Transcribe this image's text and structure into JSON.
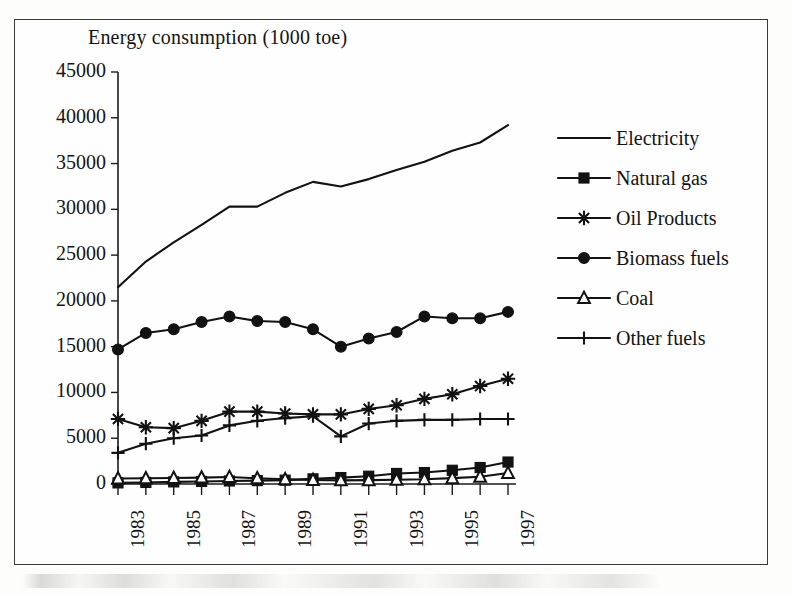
{
  "chart_data": {
    "type": "line",
    "title": "Energy consumption (1000 toe)",
    "xlabel": "",
    "ylabel": "",
    "xlim": [
      1983,
      1997
    ],
    "ylim": [
      0,
      45000
    ],
    "ytick_step": 5000,
    "grid": false,
    "legend_position": "right",
    "x": [
      1983,
      1984,
      1985,
      1986,
      1987,
      1988,
      1989,
      1990,
      1991,
      1992,
      1993,
      1994,
      1995,
      1996,
      1997
    ],
    "xtick_labels": [
      "1983",
      "1985",
      "1987",
      "1989",
      "1991",
      "1993",
      "1995",
      "1997"
    ],
    "ytick_labels": [
      "0",
      "5000",
      "10000",
      "15000",
      "20000",
      "25000",
      "30000",
      "35000",
      "40000",
      "45000"
    ],
    "series": [
      {
        "name": "Electricity",
        "marker": "none",
        "values": [
          21500,
          24300,
          26400,
          28300,
          30300,
          30300,
          31800,
          33000,
          32500,
          33300,
          34300,
          35200,
          36400,
          37300,
          39200
        ]
      },
      {
        "name": "Natural gas",
        "marker": "square-filled",
        "values": [
          120,
          170,
          230,
          280,
          330,
          370,
          420,
          560,
          700,
          850,
          1150,
          1250,
          1500,
          1800,
          2400
        ]
      },
      {
        "name": "Oil Products",
        "marker": "asterisk",
        "values": [
          7100,
          6200,
          6100,
          6900,
          7900,
          7900,
          7700,
          7600,
          7600,
          8200,
          8600,
          9300,
          9800,
          10700,
          11500
        ]
      },
      {
        "name": "Biomass fuels",
        "marker": "circle-filled",
        "values": [
          14700,
          16500,
          16900,
          17700,
          18300,
          17800,
          17700,
          16900,
          15000,
          15900,
          16600,
          18300,
          18100,
          18100,
          18800
        ]
      },
      {
        "name": "Coal",
        "marker": "triangle-open",
        "values": [
          600,
          620,
          650,
          700,
          760,
          620,
          520,
          430,
          400,
          420,
          470,
          520,
          640,
          800,
          1200
        ]
      },
      {
        "name": "Other fuels",
        "marker": "plus",
        "values": [
          3400,
          4400,
          5000,
          5300,
          6400,
          6900,
          7200,
          7400,
          5200,
          6600,
          6900,
          7000,
          7000,
          7100,
          7100
        ]
      }
    ]
  },
  "legend": {
    "items": [
      {
        "label": "Electricity",
        "marker": "none"
      },
      {
        "label": "Natural gas",
        "marker": "square-filled"
      },
      {
        "label": "Oil Products",
        "marker": "asterisk"
      },
      {
        "label": "Biomass fuels",
        "marker": "circle-filled"
      },
      {
        "label": "Coal",
        "marker": "triangle-open"
      },
      {
        "label": "Other fuels",
        "marker": "plus"
      }
    ]
  },
  "colors": {
    "ink": "#121212",
    "paper": "#fefefe",
    "frame": "#3a3a38"
  }
}
